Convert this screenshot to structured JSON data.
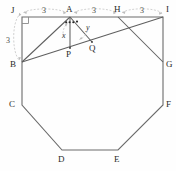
{
  "figure": {
    "stroke_color": "#6b6b6b",
    "guide_color": "#b3b3b3",
    "label_color": "#2b2b2b",
    "background": "#fefefe"
  },
  "vertices": [
    {
      "name": "J",
      "label": "J",
      "x": 22,
      "y": 17,
      "label_x": 11,
      "label_y": 6
    },
    {
      "name": "A",
      "label": "A",
      "x": 70,
      "y": 17,
      "label_x": 66,
      "label_y": 5
    },
    {
      "name": "H",
      "label": "H",
      "x": 118,
      "y": 17,
      "label_x": 114,
      "label_y": 5
    },
    {
      "name": "I",
      "label": "I",
      "x": 163,
      "y": 17,
      "label_x": 166,
      "label_y": 5
    },
    {
      "name": "B",
      "label": "B",
      "x": 22,
      "y": 62,
      "label_x": 10,
      "label_y": 60
    },
    {
      "name": "G",
      "label": "G",
      "x": 163,
      "y": 62,
      "label_x": 166,
      "label_y": 60
    },
    {
      "name": "C",
      "label": "C",
      "x": 22,
      "y": 105,
      "label_x": 9,
      "label_y": 100
    },
    {
      "name": "F",
      "label": "F",
      "x": 163,
      "y": 105,
      "label_x": 166,
      "label_y": 100
    },
    {
      "name": "D",
      "label": "D",
      "x": 62,
      "y": 150,
      "label_x": 58,
      "label_y": 155
    },
    {
      "name": "E",
      "label": "E",
      "x": 118,
      "y": 150,
      "label_x": 114,
      "label_y": 155
    }
  ],
  "interior_points": [
    {
      "name": "P",
      "label": "P",
      "x": 70,
      "y": 48,
      "label_x": 66,
      "label_y": 50
    },
    {
      "name": "Q",
      "label": "Q",
      "x": 92,
      "y": 42,
      "label_x": 89,
      "label_y": 44
    }
  ],
  "polygon_path": "J A H I G F E D C B",
  "construction_lines": [
    {
      "name": "line-A-B",
      "from": "A",
      "to": "B"
    },
    {
      "name": "line-A-P",
      "from": "A",
      "to": "P"
    },
    {
      "name": "line-A-Q",
      "from": "A",
      "to": "Q"
    },
    {
      "name": "line-B-I",
      "from": "B",
      "to": "I"
    },
    {
      "name": "line-H-G",
      "from": "H",
      "to": "G"
    }
  ],
  "dimensions": [
    {
      "name": "dim-J-A",
      "value": "3",
      "x": 42,
      "y": 7,
      "span_from": "J",
      "span_to": "A"
    },
    {
      "name": "dim-A-H",
      "value": "3",
      "x": 92,
      "y": 7,
      "span_from": "A",
      "span_to": "H"
    },
    {
      "name": "dim-H-I",
      "value": "3",
      "x": 140,
      "y": 7,
      "span_from": "H",
      "span_to": "I"
    },
    {
      "name": "dim-J-B",
      "value": "3",
      "x": 6,
      "y": 37,
      "span_from": "J",
      "span_to": "B"
    }
  ],
  "angles": [
    {
      "name": "angle-x",
      "label": "x",
      "x": 62,
      "y": 32,
      "at": "A",
      "between": "AB and AP"
    },
    {
      "name": "angle-y",
      "label": "y",
      "x": 86,
      "y": 24,
      "at": "A",
      "between": "AP and AQ"
    }
  ],
  "marks": {
    "right_angle_at": "J",
    "angle_tick_dots": 4
  }
}
